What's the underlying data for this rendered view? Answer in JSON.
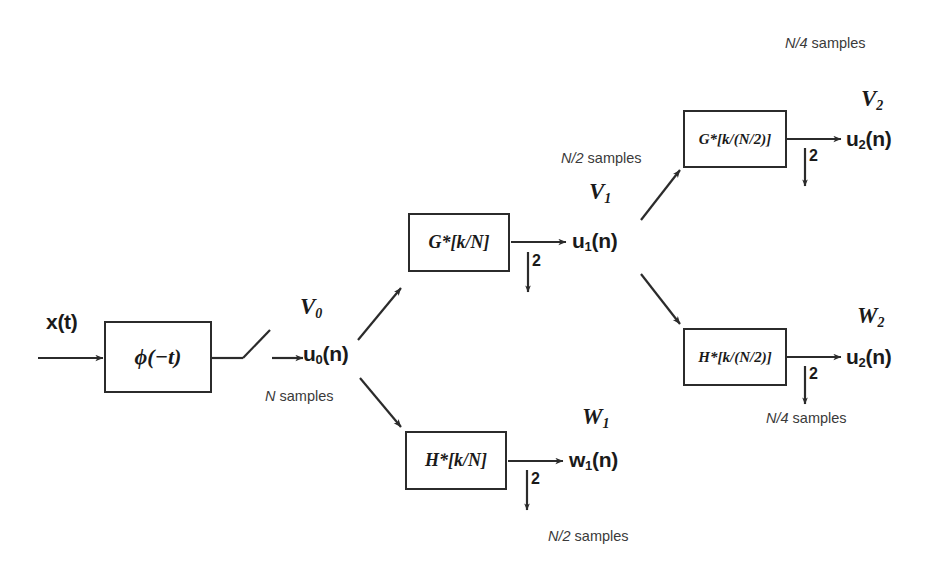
{
  "diagram": {
    "stroke_color": "#2b2b2b",
    "text_color": "#1a1a1a",
    "input": {
      "signal_label": "x(t)",
      "analysis_block": "ϕ(−t)",
      "switch": "sampling-switch"
    },
    "stage0": {
      "space_label": "V",
      "space_sub": "0",
      "signal": "u",
      "signal_sub": "0",
      "signal_tail": "(n)",
      "samples_note_prefix": "N",
      "samples_note_suffix": " samples"
    },
    "stage1": {
      "highpass_box": "G*[k/N]",
      "lowpass_box": "H*[k/N]",
      "decimate": "2",
      "decimate_symbol": "↓",
      "upper_space": "V",
      "upper_space_sub": "1",
      "upper_signal": "u",
      "upper_signal_sub": "1",
      "upper_signal_tail": "(n)",
      "upper_samples_prefix": "N/2",
      "upper_samples_suffix": " samples",
      "lower_space": "W",
      "lower_space_sub": "1",
      "lower_signal": "w",
      "lower_signal_sub": "1",
      "lower_signal_tail": "(n)",
      "lower_samples_prefix": "N/2",
      "lower_samples_suffix": " samples"
    },
    "stage2": {
      "highpass_box": "G*[k/(N/2)]",
      "lowpass_box": "H*[k/(N/2)]",
      "decimate": "2",
      "decimate_symbol": "↓",
      "upper_space": "V",
      "upper_space_sub": "2",
      "upper_signal": "u",
      "upper_signal_sub": "2",
      "upper_signal_tail": "(n)",
      "upper_samples_prefix": "N/4",
      "upper_samples_suffix": " samples",
      "lower_space": "W",
      "lower_space_sub": "2",
      "lower_signal": "u",
      "lower_signal_sub": "2",
      "lower_signal_tail": "(n)",
      "lower_samples_prefix": "N/4",
      "lower_samples_suffix": " samples"
    }
  }
}
